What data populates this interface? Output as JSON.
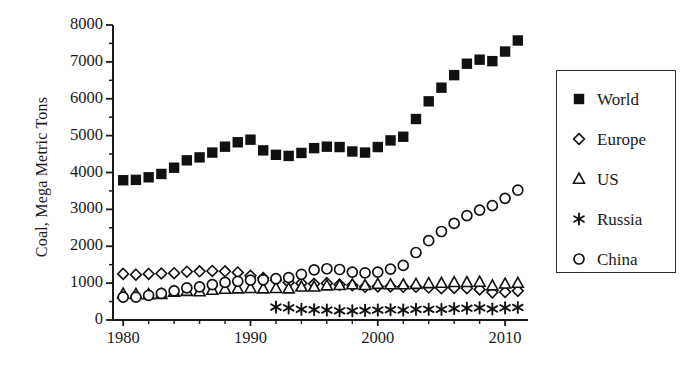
{
  "chart_data": {
    "type": "scatter",
    "title": "",
    "xlabel": "",
    "ylabel": "Coal, Mega Metric Tons",
    "xlim": [
      1979.2,
      2011.8
    ],
    "ylim": [
      0,
      8000
    ],
    "xticks": [
      1980,
      1990,
      2000,
      2010
    ],
    "xticklabels": [
      "1980",
      "1990",
      "2000",
      "2010"
    ],
    "xminor_step": 2,
    "yticks": [
      0,
      1000,
      2000,
      3000,
      4000,
      5000,
      6000,
      7000,
      8000
    ],
    "yticklabels": [
      "0",
      "1000",
      "2000",
      "3000",
      "4000",
      "5000",
      "6000",
      "7000",
      "8000"
    ],
    "yminor_step": 500,
    "grid": false,
    "legend_position": "right-outside",
    "marker_color": "#111111",
    "axis_color": "#1a1a1a",
    "series": [
      {
        "name": "World",
        "marker": "filled-square",
        "x": [
          1980,
          1981,
          1982,
          1983,
          1984,
          1985,
          1986,
          1987,
          1988,
          1989,
          1990,
          1991,
          1992,
          1993,
          1994,
          1995,
          1996,
          1997,
          1998,
          1999,
          2000,
          2001,
          2002,
          2003,
          2004,
          2005,
          2006,
          2007,
          2008,
          2009,
          2010,
          2011
        ],
        "y": [
          3790,
          3800,
          3870,
          3960,
          4130,
          4330,
          4410,
          4540,
          4700,
          4820,
          4890,
          4600,
          4480,
          4450,
          4530,
          4660,
          4700,
          4690,
          4570,
          4540,
          4690,
          4870,
          4970,
          5450,
          5930,
          6300,
          6640,
          6950,
          7060,
          7020,
          7280,
          7580
        ]
      },
      {
        "name": "Europe",
        "marker": "diamond",
        "x": [
          1980,
          1981,
          1982,
          1983,
          1984,
          1985,
          1986,
          1987,
          1988,
          1989,
          1990,
          1991,
          1992,
          1993,
          1994,
          1995,
          1996,
          1997,
          1998,
          1999,
          2000,
          2001,
          2002,
          2003,
          2004,
          2005,
          2006,
          2007,
          2008,
          2009,
          2010,
          2011
        ],
        "y": [
          1250,
          1230,
          1250,
          1260,
          1270,
          1310,
          1320,
          1330,
          1320,
          1290,
          1200,
          1140,
          1080,
          1020,
          1000,
          980,
          1000,
          960,
          940,
          900,
          910,
          910,
          900,
          900,
          880,
          860,
          870,
          860,
          830,
          750,
          760,
          790
        ]
      },
      {
        "name": "US",
        "marker": "triangle",
        "x": [
          1980,
          1981,
          1982,
          1983,
          1984,
          1985,
          1986,
          1987,
          1988,
          1989,
          1990,
          1991,
          1992,
          1993,
          1994,
          1995,
          1996,
          1997,
          1998,
          1999,
          2000,
          2001,
          2002,
          2003,
          2004,
          2005,
          2006,
          2007,
          2008,
          2009,
          2010,
          2011
        ],
        "y": [
          710,
          700,
          690,
          700,
          760,
          780,
          770,
          810,
          840,
          850,
          860,
          850,
          860,
          850,
          900,
          900,
          930,
          940,
          960,
          940,
          970,
          960,
          960,
          970,
          990,
          1000,
          1020,
          1020,
          1030,
          930,
          980,
          1000
        ]
      },
      {
        "name": "Russia",
        "marker": "asterisk",
        "x": [
          1992,
          1993,
          1994,
          1995,
          1996,
          1997,
          1998,
          1999,
          2000,
          2001,
          2002,
          2003,
          2004,
          2005,
          2006,
          2007,
          2008,
          2009,
          2010,
          2011
        ],
        "y": [
          350,
          330,
          290,
          280,
          270,
          250,
          250,
          260,
          270,
          280,
          270,
          290,
          290,
          290,
          310,
          320,
          330,
          300,
          330,
          340
        ]
      },
      {
        "name": "China",
        "marker": "circle",
        "x": [
          1980,
          1981,
          1982,
          1983,
          1984,
          1985,
          1986,
          1987,
          1988,
          1989,
          1990,
          1991,
          1992,
          1993,
          1994,
          1995,
          1996,
          1997,
          1998,
          1999,
          2000,
          2001,
          2002,
          2003,
          2004,
          2005,
          2006,
          2007,
          2008,
          2009,
          2010,
          2011
        ],
        "y": [
          620,
          620,
          670,
          720,
          790,
          870,
          900,
          960,
          1020,
          1050,
          1080,
          1090,
          1120,
          1150,
          1240,
          1360,
          1390,
          1370,
          1300,
          1280,
          1300,
          1380,
          1480,
          1830,
          2150,
          2400,
          2620,
          2830,
          2980,
          3100,
          3300,
          3520
        ]
      }
    ]
  },
  "legend": {
    "items": [
      {
        "label": "World",
        "marker": "filled-square"
      },
      {
        "label": "Europe",
        "marker": "diamond"
      },
      {
        "label": "US",
        "marker": "triangle"
      },
      {
        "label": "Russia",
        "marker": "asterisk"
      },
      {
        "label": "China",
        "marker": "circle"
      }
    ]
  }
}
